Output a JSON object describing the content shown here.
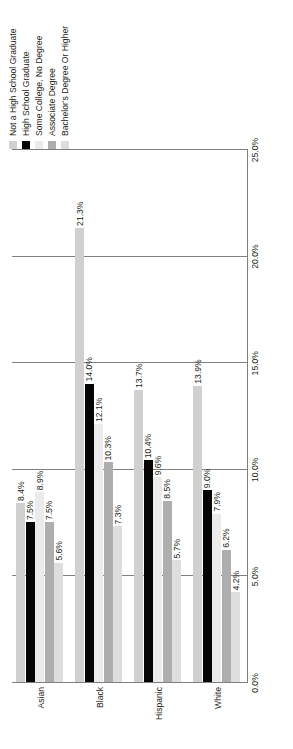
{
  "chart_data": {
    "type": "bar",
    "orientation": "horizontal",
    "title": "",
    "subtitle": "",
    "xlabel": "",
    "ylabel": "",
    "xlim": [
      0.0,
      25.0
    ],
    "xticks": [
      "0.0%",
      "5.0%",
      "10.0%",
      "15.0%",
      "20.0%",
      "25.0%"
    ],
    "xtick_values": [
      0.0,
      5.0,
      10.0,
      15.0,
      20.0,
      25.0
    ],
    "grid": true,
    "legend_position": "top-left",
    "value_suffix": "%",
    "categories": [
      "Asian",
      "Black",
      "Hispanic",
      "White"
    ],
    "series": [
      {
        "name": "Not a High School Graduate",
        "color": "#d0d0d0",
        "values": [
          8.4,
          21.3,
          13.7,
          13.9
        ],
        "labels": [
          "8.4%",
          "21.3%",
          "13.7%",
          "13.9%"
        ]
      },
      {
        "name": "High School Graduate",
        "color": "#050505",
        "values": [
          7.5,
          14.0,
          10.4,
          9.0
        ],
        "labels": [
          "7.5%",
          "14.0%",
          "10.4%",
          "9.0%"
        ]
      },
      {
        "name": "Some College, No Degree",
        "color": "#ebebeb",
        "values": [
          8.9,
          12.1,
          9.6,
          7.9
        ],
        "labels": [
          "8.9%",
          "12.1%",
          "9.6%",
          "7.9%"
        ]
      },
      {
        "name": "Associate Degree",
        "color": "#aeaeae",
        "values": [
          7.5,
          10.3,
          8.5,
          6.2
        ],
        "labels": [
          "7.5%",
          "10.3%",
          "8.5%",
          "6.2%"
        ]
      },
      {
        "name": "Bachelor's Degree Or Higher",
        "color": "#dedede",
        "values": [
          5.6,
          7.3,
          5.7,
          4.2
        ],
        "labels": [
          "5.6%",
          "7.3%",
          "5.7%",
          "4.2%"
        ]
      }
    ]
  },
  "legend": {
    "items": [
      {
        "label": "Not a High School Graduate",
        "color": "#d0d0d0"
      },
      {
        "label": "High School Graduate",
        "color": "#050505"
      },
      {
        "label": "Some College, No Degree",
        "color": "#ebebeb"
      },
      {
        "label": "Associate Degree",
        "color": "#aeaeae"
      },
      {
        "label": "Bachelor's Degree Or Higher",
        "color": "#dedede"
      }
    ]
  },
  "axis": {
    "tick_labels": [
      "0.0%",
      "5.0%",
      "10.0%",
      "15.0%",
      "20.0%",
      "25.0%"
    ]
  },
  "category_labels": [
    "Asian",
    "Black",
    "Hispanic",
    "White"
  ]
}
